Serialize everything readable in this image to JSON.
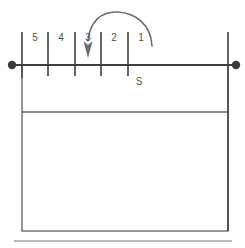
{
  "figure": {
    "background_color": "#ffffff",
    "line_color": "#4a4a4a",
    "light_line_color": "#9a9a9a",
    "arrow_color": "#6b6b6b",
    "text_color": "#4f4f4f",
    "width": 245,
    "height": 248
  },
  "surface_line": {
    "name": "surface-line",
    "y": 65,
    "x_start": 11,
    "x_end": 236,
    "left_endpoint_marker": "filled-dot",
    "right_endpoint_marker": "filled-dot",
    "endpoint_radius": 4
  },
  "ticks": [
    {
      "label": "",
      "x": 22,
      "y_top": 32,
      "y_bottom": 76
    },
    {
      "label": "",
      "x": 48,
      "y_top": 32,
      "y_bottom": 76
    },
    {
      "label": "",
      "x": 75,
      "y_top": 32,
      "y_bottom": 76
    },
    {
      "label": "",
      "x": 101,
      "y_top": 32,
      "y_bottom": 76
    },
    {
      "label": "",
      "x": 128,
      "y_top": 32,
      "y_bottom": 76
    }
  ],
  "interval_labels": [
    {
      "text": "5",
      "x": 35,
      "y": 38
    },
    {
      "text": "4",
      "x": 61,
      "y": 38
    },
    {
      "text": "3",
      "x": 88,
      "y": 38
    },
    {
      "text": "2",
      "x": 114,
      "y": 38
    },
    {
      "text": "1",
      "x": 141,
      "y": 38
    }
  ],
  "right_boundary": {
    "name": "right-boundary-line",
    "x": 228,
    "y_top": 32,
    "y_bottom": 231
  },
  "body_box": {
    "name": "section-body-box",
    "left": 22,
    "right": 228,
    "top": 65,
    "bottom": 231
  },
  "internal_divider": {
    "name": "internal-divider-line",
    "y": 112,
    "x_start": 22,
    "x_end": 228
  },
  "bottom_rule": {
    "name": "bottom-rule-line",
    "y": 241,
    "x_start": 14,
    "x_end": 232
  },
  "region_labels": [
    {
      "text": "S",
      "x": 139,
      "y": 82
    }
  ],
  "arrow": {
    "name": "curved-direction-arrow",
    "description": "arc from right sweeping left and down",
    "start_x": 152,
    "start_y": 45,
    "end_x": 88,
    "end_y": 46,
    "arrowhead_tip_x": 88,
    "arrowhead_tip_y": 58,
    "color": "#6b6b6b"
  }
}
